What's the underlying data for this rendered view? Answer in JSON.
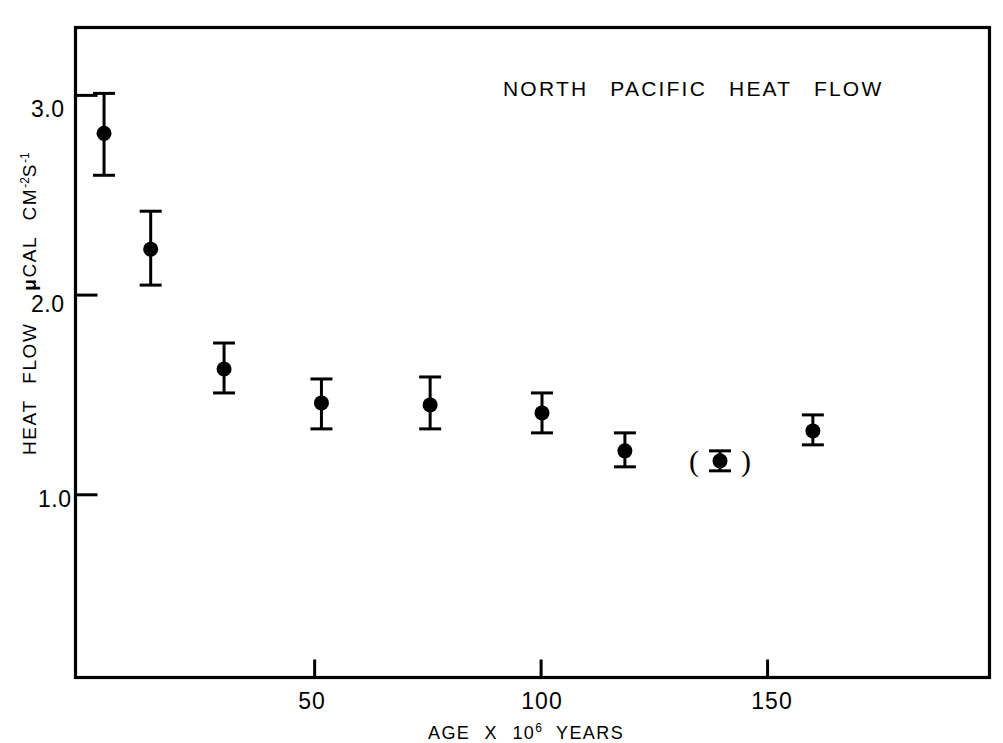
{
  "chart_data": {
    "type": "scatter",
    "title": "NORTH  PACIFIC  HEAT  FLOW",
    "xlabel_parts": {
      "pre": "AGE  X  10",
      "sup": "6",
      "post": " YEARS"
    },
    "xlabel": "AGE X 10^6 YEARS",
    "ylabel_parts": {
      "main": "HEAT  FLOW",
      "unit_pre": "CAL CM",
      "unit_sup1": "-2",
      "unit_mid": "S",
      "unit_sup2": "-1",
      "mu": "μ"
    },
    "ylabel": "HEAT FLOW μCAL CM-2S-1",
    "xlim": [
      -2.8,
      199
    ],
    "ylim": [
      0.085,
      3.34
    ],
    "xticks": [
      50,
      100,
      150
    ],
    "xtick_labels": [
      "50",
      "100",
      "150"
    ],
    "yticks": [
      1.0,
      2.0,
      3.0
    ],
    "ytick_labels": [
      "1.0",
      "2.0",
      "3.0"
    ],
    "grid": false,
    "legend": "none",
    "marker": "filled-circle",
    "error_bars": "vertical-with-caps",
    "series": [
      {
        "name": "North Pacific heat flow vs crustal age",
        "points": [
          {
            "x": 3.5,
            "y": 2.81,
            "yerr_low": 2.6,
            "yerr_high": 3.01,
            "parenthesized": false
          },
          {
            "x": 13.8,
            "y": 2.23,
            "yerr_low": 2.05,
            "yerr_high": 2.42,
            "parenthesized": false
          },
          {
            "x": 30.0,
            "y": 1.63,
            "yerr_low": 1.51,
            "yerr_high": 1.76,
            "parenthesized": false
          },
          {
            "x": 51.5,
            "y": 1.46,
            "yerr_low": 1.33,
            "yerr_high": 1.58,
            "parenthesized": false
          },
          {
            "x": 75.5,
            "y": 1.45,
            "yerr_low": 1.33,
            "yerr_high": 1.59,
            "parenthesized": false
          },
          {
            "x": 100.2,
            "y": 1.41,
            "yerr_low": 1.31,
            "yerr_high": 1.51,
            "parenthesized": false
          },
          {
            "x": 118.5,
            "y": 1.22,
            "yerr_low": 1.14,
            "yerr_high": 1.31,
            "parenthesized": false
          },
          {
            "x": 139.5,
            "y": 1.17,
            "yerr_low": 1.12,
            "yerr_high": 1.22,
            "parenthesized": true
          },
          {
            "x": 160.0,
            "y": 1.32,
            "yerr_low": 1.25,
            "yerr_high": 1.4,
            "parenthesized": false
          }
        ]
      }
    ],
    "colors": {
      "ink": "#000000",
      "background": "#ffffff"
    }
  }
}
